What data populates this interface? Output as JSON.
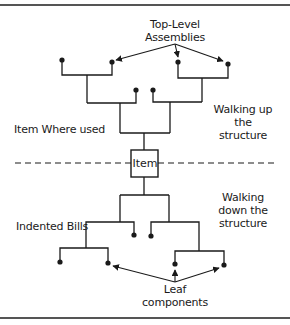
{
  "diagram": {
    "labels": {
      "top_level_line1": "Top-Level",
      "top_level_line2": "Assemblies",
      "where_used": "Item Where used",
      "walking_up_line1": "Walking up",
      "walking_up_line2": "the",
      "walking_up_line3": "structure",
      "item": "Item",
      "walking_down_line1": "Walking",
      "walking_down_line2": "down the",
      "walking_down_line3": "structure",
      "indented_bills": "Indented Bills",
      "leaf_line1": "Leaf",
      "leaf_line2": "components"
    },
    "colors": {
      "line": "#1a1a1a",
      "border": "#555555",
      "background": "#ffffff"
    }
  }
}
